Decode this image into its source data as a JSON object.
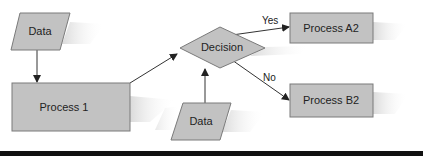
{
  "colors": {
    "shape_fill": "#c2c2c2",
    "shape_stroke": "#7a7a7a",
    "arrow": "#333333",
    "shadow": "#e4e4e4",
    "bar": "#111111"
  },
  "nodes": {
    "data_top": {
      "label": "Data",
      "type": "data"
    },
    "process_1": {
      "label": "Process 1",
      "type": "process"
    },
    "decision": {
      "label": "Decision",
      "type": "decision"
    },
    "data_bottom": {
      "label": "Data",
      "type": "data"
    },
    "process_a2": {
      "label": "Process A2",
      "type": "process"
    },
    "process_b2": {
      "label": "Process B2",
      "type": "process"
    }
  },
  "edges": [
    {
      "from": "data_top",
      "to": "process_1",
      "label": ""
    },
    {
      "from": "process_1",
      "to": "decision",
      "label": ""
    },
    {
      "from": "data_bottom",
      "to": "decision",
      "label": ""
    },
    {
      "from": "decision",
      "to": "process_a2",
      "label": "Yes"
    },
    {
      "from": "decision",
      "to": "process_b2",
      "label": "No"
    }
  ],
  "edge_labels": {
    "yes": "Yes",
    "no": "No"
  }
}
